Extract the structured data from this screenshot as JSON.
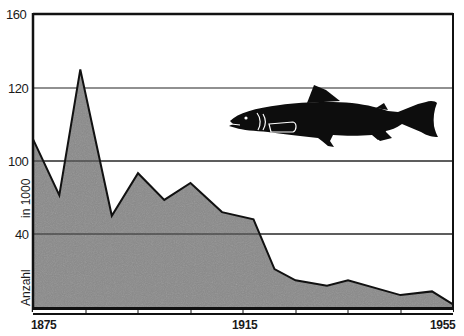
{
  "chart_data": {
    "type": "area",
    "title": "",
    "xlabel": "",
    "ylabel": "Anzahl in 1000",
    "x_tick_labels": [
      "1875",
      "1915",
      "1955"
    ],
    "y_tick_labels": [
      "160",
      "120",
      "100",
      "40"
    ],
    "xlim": [
      1875,
      1955
    ],
    "grid": "horizontal lines at labeled y ticks",
    "legend": null,
    "annotation": "salmon silhouette illustration",
    "x": [
      1875,
      1880,
      1884,
      1890,
      1895,
      1900,
      1905,
      1911,
      1917,
      1921,
      1925,
      1931,
      1935,
      1945,
      1951,
      1955
    ],
    "values": [
      106,
      72,
      130,
      55,
      90,
      68,
      82,
      58,
      52,
      21,
      15,
      12,
      15,
      7,
      9,
      2
    ],
    "fill_color": "#8a8a8a",
    "line_color": "#111111"
  },
  "labels": {
    "y_160": "160",
    "y_120": "120",
    "y_100": "100",
    "y_40": "40",
    "x_1875": "1875",
    "x_1915": "1915",
    "x_1955": "1955",
    "y_title_unit": "in 1000",
    "y_title_word": "Anzahl"
  }
}
